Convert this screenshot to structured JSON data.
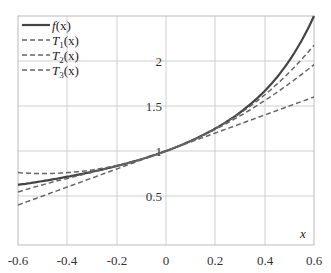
{
  "chart_data": {
    "type": "line",
    "title": "",
    "xlabel": "x",
    "ylabel": "",
    "xlim": [
      -0.6,
      0.6
    ],
    "ylim": [
      -0.04,
      2.5
    ],
    "grid": true,
    "legend_position": "upper left",
    "xticks": [
      "-0.6",
      "-0.4",
      "-0.2",
      "0",
      "0.2",
      "0.4",
      "0.6"
    ],
    "yticks": [
      "0.5",
      "1",
      "1.5",
      "2"
    ],
    "x": [
      -0.6,
      -0.4,
      -0.2,
      0,
      0.2,
      0.4,
      0.6
    ],
    "series": [
      {
        "name": "f(x)",
        "style": "solid",
        "color": "#444444",
        "values": [
          0.625,
          0.714,
          0.833,
          1.0,
          1.25,
          1.667,
          2.5
        ]
      },
      {
        "name": "T1(x)",
        "style": "dashed",
        "color": "#666666",
        "values": [
          0.4,
          0.6,
          0.8,
          1.0,
          1.2,
          1.4,
          1.6
        ]
      },
      {
        "name": "T2(x)",
        "style": "dashed",
        "color": "#666666",
        "values": [
          0.76,
          0.76,
          0.84,
          1.0,
          1.24,
          1.56,
          1.96
        ]
      },
      {
        "name": "T3(x)",
        "style": "dashed",
        "color": "#666666",
        "values": [
          0.544,
          0.696,
          0.832,
          1.0,
          1.248,
          1.624,
          2.176
        ]
      }
    ]
  },
  "legend": {
    "f": {
      "name": "f",
      "arg": "(x)"
    },
    "t1": {
      "name": "T",
      "sub": "1",
      "arg": "(x)"
    },
    "t2": {
      "name": "T",
      "sub": "2",
      "arg": "(x)"
    },
    "t3": {
      "name": "T",
      "sub": "3",
      "arg": "(x)"
    }
  },
  "axis": {
    "x_label": "x"
  },
  "ticks": {
    "x": [
      "-0.6",
      "-0.4",
      "-0.2",
      "0",
      "0.2",
      "0.4",
      "0.6"
    ],
    "y": [
      "0.5",
      "1",
      "1.5",
      "2"
    ]
  }
}
